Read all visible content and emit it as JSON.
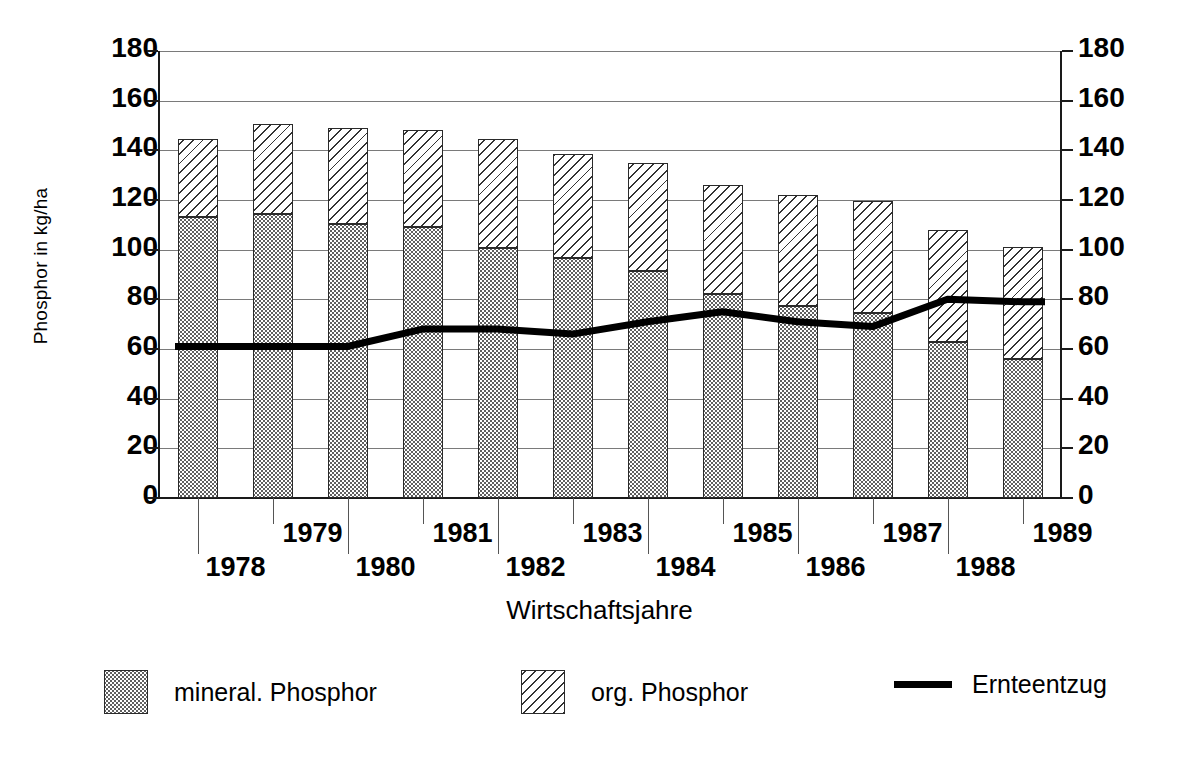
{
  "chart_data": {
    "type": "bar",
    "title": "",
    "xlabel": "Wirtschaftsjahre",
    "ylabel": "Phosphor in kg/ha",
    "categories": [
      "1978",
      "1979",
      "1980",
      "1981",
      "1982",
      "1983",
      "1984",
      "1985",
      "1986",
      "1987",
      "1988",
      "1989"
    ],
    "ylim": [
      0,
      180
    ],
    "yticks": [
      0,
      20,
      40,
      60,
      80,
      100,
      120,
      140,
      160,
      180
    ],
    "grid": true,
    "stacked": true,
    "dual_axis": true,
    "legend_position": "bottom",
    "series": [
      {
        "name": "mineral. Phosphor",
        "pattern": "dotted",
        "values": [
          113,
          114.5,
          110.5,
          109,
          100.5,
          96.5,
          91.5,
          82,
          77.5,
          74.5,
          63,
          56
        ]
      },
      {
        "name": "org. Phosphor",
        "pattern": "diagonal-hatch",
        "values": [
          31.5,
          36,
          38.5,
          39,
          44,
          42,
          43.5,
          44,
          44.5,
          45,
          45,
          45
        ]
      },
      {
        "name": "Ernteentzug",
        "pattern": "line",
        "values": [
          61,
          61,
          61,
          68,
          68,
          66,
          71,
          75,
          71,
          69,
          80,
          79
        ]
      }
    ],
    "totals": [
      144.5,
      150.5,
      149,
      148,
      144.5,
      138.5,
      135,
      126,
      122,
      119.5,
      108,
      101
    ]
  },
  "axes": {
    "y_left_ticks": [
      "180",
      "160",
      "140",
      "120",
      "100",
      "80",
      "60",
      "40",
      "20",
      "0"
    ],
    "y_right_ticks": [
      "180",
      "160",
      "140",
      "120",
      "100",
      "80",
      "60",
      "40",
      "20",
      "0"
    ],
    "y_title": "Phosphor in kg/ha",
    "x_title": "Wirtschaftsjahre"
  },
  "legend": {
    "items": [
      {
        "label": "mineral. Phosphor",
        "marker": "dotted-swatch"
      },
      {
        "label": "org. Phosphor",
        "marker": "hatched-swatch"
      },
      {
        "label": "Ernteentzug",
        "marker": "line-swatch"
      }
    ]
  },
  "colors": {
    "line": "#000000",
    "axis": "#1a1a1a",
    "grid": "#7a7a7a",
    "background": "#ffffff"
  }
}
